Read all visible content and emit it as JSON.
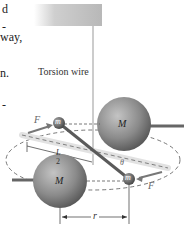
{
  "text_fragments": [
    {
      "text": "d",
      "top": 3
    },
    {
      "text": "-",
      "top": 21
    },
    {
      "text": "way,",
      "top": 31
    },
    {
      "text": "n.",
      "top": 67
    },
    {
      "text": "-",
      "top": 99
    }
  ],
  "diagram": {
    "labels": {
      "torsion_wire": "Torsion wire",
      "large_mass": "M",
      "small_mass": "m",
      "force": "F",
      "half_length_num": "L",
      "half_length_den": "2",
      "angle": "θ",
      "separation": "r"
    },
    "colors": {
      "sphere_large": "#8a8a8a",
      "sphere_small": "#6e6e6e",
      "rod": "#5a5a5a",
      "force_arrow": "#7a7a7a",
      "dashed_path": "#555555",
      "plate": "#c8c8c8"
    }
  }
}
